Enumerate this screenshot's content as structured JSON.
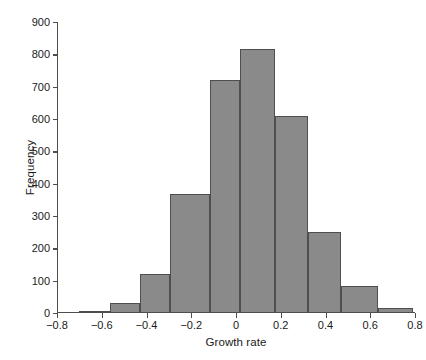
{
  "chart_data": {
    "type": "bar",
    "subtype": "histogram",
    "title": "",
    "xlabel": "Growth rate",
    "ylabel": "Frequency",
    "xlim": [
      -0.8,
      0.8
    ],
    "ylim": [
      0,
      900
    ],
    "grid": false,
    "legend": null,
    "bar_color": "#8a8a8a",
    "bar_edge_color": "#4f4f4f",
    "axis_color": "#4d4d4d",
    "background_color": "#ffffff",
    "x_ticks": [
      -0.8,
      -0.6,
      -0.4,
      -0.2,
      0,
      0.2,
      0.4,
      0.6,
      0.8
    ],
    "x_tick_labels": [
      "−0.8",
      "−0.6",
      "−0.4",
      "−0.2",
      "0",
      "0.2",
      "0.4",
      "0.6",
      "0.8"
    ],
    "y_ticks": [
      0,
      100,
      200,
      300,
      400,
      500,
      600,
      700,
      800,
      900
    ],
    "y_tick_labels": [
      "0",
      "100",
      "200",
      "300",
      "400",
      "500",
      "600",
      "700",
      "800",
      "900"
    ],
    "bin_edges": [
      -0.7,
      -0.565,
      -0.43,
      -0.295,
      -0.115,
      0.02,
      0.175,
      0.32,
      0.47,
      0.635,
      0.79
    ],
    "categories": [
      "-0.70 to -0.565",
      "-0.565 to -0.43",
      "-0.43 to -0.295",
      "-0.295 to -0.115",
      "-0.115 to 0.02",
      "0.02 to 0.175",
      "0.175 to 0.32",
      "0.32 to 0.47",
      "0.47 to 0.635",
      "0.635 to 0.79"
    ],
    "values": [
      5,
      30,
      122,
      368,
      720,
      815,
      608,
      250,
      83,
      15
    ]
  }
}
